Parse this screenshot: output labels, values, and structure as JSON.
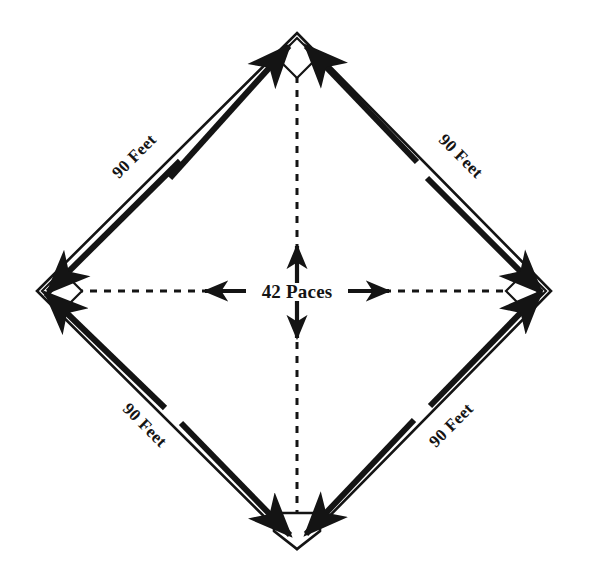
{
  "diagram": {
    "background_color": "#ffffff",
    "line_color": "#141414",
    "geometry": {
      "top_apex": {
        "x": 297,
        "y": 33
      },
      "right_base": {
        "x": 551,
        "y": 291
      },
      "bottom_apex": {
        "x": 297,
        "y": 549
      },
      "left_base": {
        "x": 37,
        "y": 291
      },
      "center": {
        "x": 297,
        "y": 291
      }
    },
    "baselines": [
      {
        "id": "home-to-first",
        "label": "90 Feet",
        "position": "bottom-right",
        "rotation": -45
      },
      {
        "id": "first-to-second",
        "label": "90 Feet",
        "position": "top-right",
        "rotation": 45
      },
      {
        "id": "second-to-third",
        "label": "90 Feet",
        "position": "top-left",
        "rotation": -45
      },
      {
        "id": "third-to-home",
        "label": "90 Feet",
        "position": "bottom-left",
        "rotation": 45
      }
    ],
    "bases": [
      {
        "id": "second-base",
        "shape": "square-diamond",
        "position": "top"
      },
      {
        "id": "first-base",
        "shape": "square-diamond",
        "position": "right"
      },
      {
        "id": "home-plate",
        "shape": "pentagon",
        "position": "bottom"
      },
      {
        "id": "third-base",
        "shape": "square-diamond",
        "position": "left"
      }
    ],
    "center_measure": {
      "label": "42 Paces",
      "arrows": [
        "up",
        "down",
        "left",
        "right"
      ],
      "dashed_axes": [
        "vertical",
        "horizontal"
      ]
    }
  }
}
